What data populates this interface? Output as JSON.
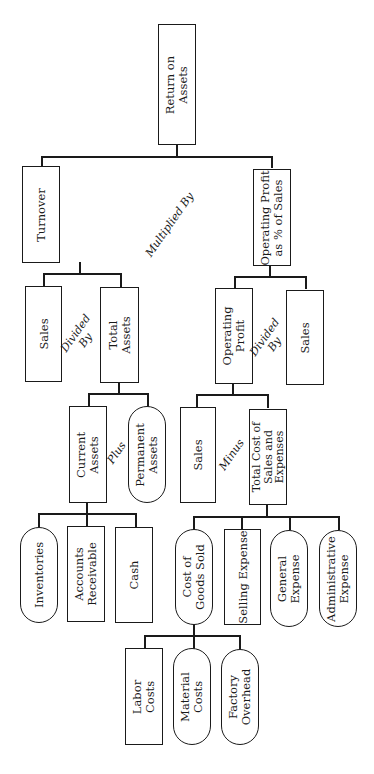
{
  "diagram": {
    "type": "tree",
    "orientation": "rotated -90deg (text reads bottom-to-top)",
    "root": "Return on Assets",
    "nodes": {
      "roa": {
        "label": "Return on\nAssets",
        "shape": "rect"
      },
      "turnover": {
        "label": "Turnover",
        "shape": "rect"
      },
      "op_pct": {
        "label": "Operating Profit\nas % of Sales",
        "shape": "rect"
      },
      "sales_a": {
        "label": "Sales",
        "shape": "rect"
      },
      "total_assets": {
        "label": "Total\nAssets",
        "shape": "rect"
      },
      "operating_profit": {
        "label": "Operating\nProfit",
        "shape": "rect"
      },
      "sales_b": {
        "label": "Sales",
        "shape": "rect"
      },
      "current_assets": {
        "label": "Current\nAssets",
        "shape": "rect"
      },
      "permanent_assets": {
        "label": "Permanent\nAssets",
        "shape": "pill"
      },
      "sales_c": {
        "label": "Sales",
        "shape": "rect"
      },
      "total_cost": {
        "label": "Total Cost of\nSales and\nExpenses",
        "shape": "rect"
      },
      "inventories": {
        "label": "Inventories",
        "shape": "pill"
      },
      "accounts_receivable": {
        "label": "Accounts\nReceivable",
        "shape": "rect"
      },
      "cash": {
        "label": "Cash",
        "shape": "rect"
      },
      "cogs": {
        "label": "Cost of\nGoods Sold",
        "shape": "pill"
      },
      "selling_expense": {
        "label": "Selling Expense",
        "shape": "rect"
      },
      "general_expense": {
        "label": "General\nExpense",
        "shape": "pill"
      },
      "admin_expense": {
        "label": "Administrative\nExpense",
        "shape": "pill"
      },
      "labor_costs": {
        "label": "Labor\nCosts",
        "shape": "rect"
      },
      "material_costs": {
        "label": "Material\nCosts",
        "shape": "pill"
      },
      "factory_overhead": {
        "label": "Factory\nOverhead",
        "shape": "pill"
      }
    },
    "operators": {
      "multiplied_by": "Multiplied By",
      "divided_by_1": "Divided\nBy",
      "divided_by_2": "Divided\nBy",
      "plus": "Plus",
      "minus": "Minus"
    },
    "edges": [
      [
        "roa",
        "turnover"
      ],
      [
        "roa",
        "op_pct"
      ],
      [
        "turnover",
        "sales_a"
      ],
      [
        "turnover",
        "total_assets"
      ],
      [
        "op_pct",
        "operating_profit"
      ],
      [
        "op_pct",
        "sales_b"
      ],
      [
        "total_assets",
        "current_assets"
      ],
      [
        "total_assets",
        "permanent_assets"
      ],
      [
        "operating_profit",
        "sales_c"
      ],
      [
        "operating_profit",
        "total_cost"
      ],
      [
        "current_assets",
        "inventories"
      ],
      [
        "current_assets",
        "accounts_receivable"
      ],
      [
        "current_assets",
        "cash"
      ],
      [
        "total_cost",
        "cogs"
      ],
      [
        "total_cost",
        "selling_expense"
      ],
      [
        "total_cost",
        "general_expense"
      ],
      [
        "total_cost",
        "admin_expense"
      ],
      [
        "cogs",
        "labor_costs"
      ],
      [
        "cogs",
        "material_costs"
      ],
      [
        "cogs",
        "factory_overhead"
      ]
    ]
  }
}
